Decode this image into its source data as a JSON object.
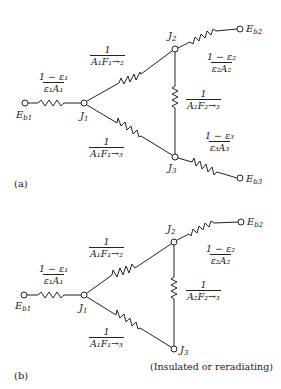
{
  "panels": [
    {
      "id": "a",
      "label": "(a)",
      "nodes": {
        "Eb1": {
          "name": "E",
          "sub": "b1"
        },
        "Eb2": {
          "name": "E",
          "sub": "b2"
        },
        "Eb3": {
          "name": "E",
          "sub": "b3"
        },
        "J1": {
          "name": "J",
          "sub": "1"
        },
        "J2": {
          "name": "J",
          "sub": "2"
        },
        "J3": {
          "name": "J",
          "sub": "3"
        }
      },
      "resistances": {
        "R1": {
          "num": "1 − ε₁",
          "den": "ε₁A₁"
        },
        "R12": {
          "num": "1",
          "den": "A₁F₁→₂"
        },
        "R13": {
          "num": "1",
          "den": "A₁F₁→₃"
        },
        "R23": {
          "num": "1",
          "den": "A₂F₂→₃"
        },
        "R2": {
          "num": "1 − ε₂",
          "den": "ε₂A₂"
        },
        "R3": {
          "num": "1 − ε₃",
          "den": "ε₃A₃"
        }
      }
    },
    {
      "id": "b",
      "label": "(b)",
      "nodes": {
        "Eb1": {
          "name": "E",
          "sub": "b1"
        },
        "Eb2": {
          "name": "E",
          "sub": "b2"
        },
        "J1": {
          "name": "J",
          "sub": "1"
        },
        "J2": {
          "name": "J",
          "sub": "2"
        },
        "J3": {
          "name": "J",
          "sub": "3"
        }
      },
      "resistances": {
        "R1": {
          "num": "1 − ε₁",
          "den": "ε₁A₁"
        },
        "R12": {
          "num": "1",
          "den": "A₁F₁→₂"
        },
        "R13": {
          "num": "1",
          "den": "A₁F₁→₃"
        },
        "R23": {
          "num": "1",
          "den": "A₂F₂→₃"
        },
        "R2": {
          "num": "1 − ε₂",
          "den": "ε₂A₂"
        }
      },
      "note": "(Insulated or reradiating)"
    }
  ]
}
